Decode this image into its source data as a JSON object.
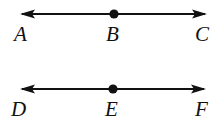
{
  "figure": {
    "background_color": "#ffffff",
    "stroke_color": "#111111",
    "lines": [
      {
        "name": "line-abc",
        "type": "double-headed-arrow",
        "left_endpoint_x": 20,
        "right_endpoint_x": 207,
        "shaft_y": 14,
        "point_marker": {
          "label_ref": "B",
          "x": 114,
          "y": 14,
          "radius": 4.5
        },
        "labels": [
          {
            "id": "A",
            "text": "A",
            "position": "left"
          },
          {
            "id": "B",
            "text": "B",
            "position": "center"
          },
          {
            "id": "C",
            "text": "C",
            "position": "right"
          }
        ]
      },
      {
        "name": "line-def",
        "type": "double-headed-arrow",
        "left_endpoint_x": 20,
        "right_endpoint_x": 206,
        "shaft_y": 89,
        "point_marker": {
          "label_ref": "E",
          "x": 113,
          "y": 89,
          "radius": 4.5
        },
        "labels": [
          {
            "id": "D",
            "text": "D",
            "position": "left"
          },
          {
            "id": "E",
            "text": "E",
            "position": "center"
          },
          {
            "id": "F",
            "text": "F",
            "position": "right"
          }
        ]
      }
    ],
    "label_text": {
      "a": "A",
      "b": "B",
      "c": "C",
      "d": "D",
      "e": "E",
      "f": "F"
    }
  }
}
